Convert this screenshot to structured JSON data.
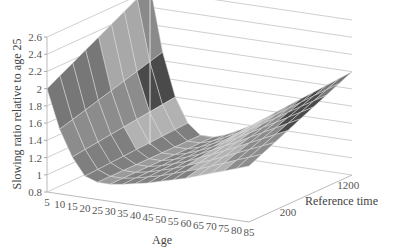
{
  "chart_data": {
    "type": "surface3d",
    "title": "",
    "zlabel": "Slowing ratio relative to age 25",
    "xlabel": "Age",
    "ylabel": "Reference time",
    "x_ticks": [
      "5",
      "10",
      "15",
      "20",
      "25",
      "30",
      "35",
      "40",
      "45",
      "50",
      "55",
      "60",
      "65",
      "70",
      "75",
      "80",
      "85"
    ],
    "y_ticks": [
      "200",
      "1200"
    ],
    "z_ticks": [
      "0.8",
      "1",
      "1.2",
      "1.4",
      "1.6",
      "1.8",
      "2",
      "2.2",
      "2.4",
      "2.6"
    ],
    "zlim": [
      0.8,
      2.6
    ],
    "xlim": [
      5,
      85
    ],
    "ylim": [
      200,
      1200
    ],
    "grid": true,
    "legend": null,
    "colormap": "grayscale bands of 0.2",
    "surface_description": "U-shaped surface: high at young ages (~2.0 at age 5 near edge, peaking ~2.65 at age 5 / high reference time), minimum ~1.0 around ages 20-35, then rising to ~2.0 at age 85 / high reference time",
    "x": [
      5,
      10,
      15,
      20,
      25,
      30,
      35,
      40,
      45,
      50,
      55,
      60,
      65,
      70,
      75,
      80,
      85
    ],
    "series": [
      {
        "name": "Reference time 200",
        "values": [
          2.0,
          1.55,
          1.25,
          1.05,
          1.0,
          1.0,
          1.02,
          1.05,
          1.08,
          1.12,
          1.16,
          1.2,
          1.25,
          1.3,
          1.35,
          1.4,
          1.45
        ]
      },
      {
        "name": "Reference time 1200",
        "values": [
          2.65,
          1.9,
          1.4,
          1.12,
          1.0,
          1.0,
          1.05,
          1.12,
          1.2,
          1.3,
          1.4,
          1.5,
          1.6,
          1.7,
          1.8,
          1.9,
          2.0
        ]
      }
    ]
  }
}
